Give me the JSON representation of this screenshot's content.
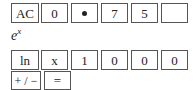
{
  "row1": {
    "keys": [
      "AC",
      "0",
      "•",
      "7",
      "5",
      ""
    ]
  },
  "function_label": {
    "base": "e",
    "exponent": "x"
  },
  "row2": {
    "keys": [
      "ln",
      "x",
      "1",
      "0",
      "0",
      "0"
    ]
  },
  "row3": {
    "keys": [
      "+ / −",
      "="
    ]
  }
}
